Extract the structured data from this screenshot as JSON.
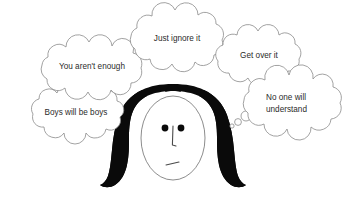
{
  "illustration": {
    "title": "Woman surrounded by dismissive thought bubbles",
    "background_color": "#ffffff",
    "outline_color": "#8a8a8a",
    "text_color": "#2b2b2b",
    "hair_color": "#0a0a0a",
    "skin_color": "#ffffff"
  },
  "bubbles": [
    {
      "id": "boys-will-be-boys",
      "lines": [
        "Boys will be boys"
      ],
      "line1": "Boys will be boys",
      "position": "left-lower"
    },
    {
      "id": "you-arent-enough",
      "lines": [
        "You aren't enough"
      ],
      "line1": "You aren't enough",
      "position": "left-upper"
    },
    {
      "id": "just-ignore-it",
      "lines": [
        "Just ignore it"
      ],
      "line1": "Just ignore it",
      "position": "top-center"
    },
    {
      "id": "get-over-it",
      "lines": [
        "Get over it"
      ],
      "line1": "Get over it",
      "position": "right-upper"
    },
    {
      "id": "no-one-will-understand",
      "lines": [
        "No one will",
        "understand"
      ],
      "line1": "No one will",
      "line2": "understand",
      "position": "right-lower"
    }
  ],
  "character": {
    "name": "woman-face",
    "hair_style": "long-black-center-part",
    "expression": "neutral-sad",
    "features": [
      "left-eye",
      "right-eye",
      "nose",
      "mouth"
    ]
  },
  "thought_tail": {
    "name": "thought-tail-circles",
    "count": 3,
    "direction": "lower-left"
  }
}
